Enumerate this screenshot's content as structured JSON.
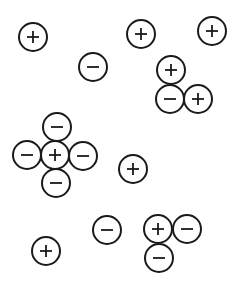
{
  "diagram": {
    "title": "",
    "background": "#ffffff",
    "stroke_color": "#1a1a1a",
    "radius": 14,
    "charges": [
      {
        "id": "c1",
        "sign": "+",
        "x": 33,
        "y": 37
      },
      {
        "id": "c2",
        "sign": "+",
        "x": 141,
        "y": 34
      },
      {
        "id": "c3",
        "sign": "+",
        "x": 212,
        "y": 31
      },
      {
        "id": "c4",
        "sign": "-",
        "x": 93,
        "y": 67
      },
      {
        "id": "c5",
        "sign": "+",
        "x": 171,
        "y": 70
      },
      {
        "id": "c6",
        "sign": "-",
        "x": 170,
        "y": 99
      },
      {
        "id": "c7",
        "sign": "+",
        "x": 198,
        "y": 99
      },
      {
        "id": "c8",
        "sign": "-",
        "x": 57,
        "y": 127
      },
      {
        "id": "c9",
        "sign": "-",
        "x": 27,
        "y": 155
      },
      {
        "id": "c10",
        "sign": "+",
        "x": 55,
        "y": 155
      },
      {
        "id": "c11",
        "sign": "-",
        "x": 83,
        "y": 156
      },
      {
        "id": "c12",
        "sign": "-",
        "x": 56,
        "y": 183
      },
      {
        "id": "c13",
        "sign": "+",
        "x": 133,
        "y": 169
      },
      {
        "id": "c14",
        "sign": "-",
        "x": 107,
        "y": 230
      },
      {
        "id": "c15",
        "sign": "+",
        "x": 158,
        "y": 229
      },
      {
        "id": "c16",
        "sign": "-",
        "x": 187,
        "y": 229
      },
      {
        "id": "c17",
        "sign": "-",
        "x": 159,
        "y": 258
      },
      {
        "id": "c18",
        "sign": "+",
        "x": 46,
        "y": 251
      }
    ]
  }
}
